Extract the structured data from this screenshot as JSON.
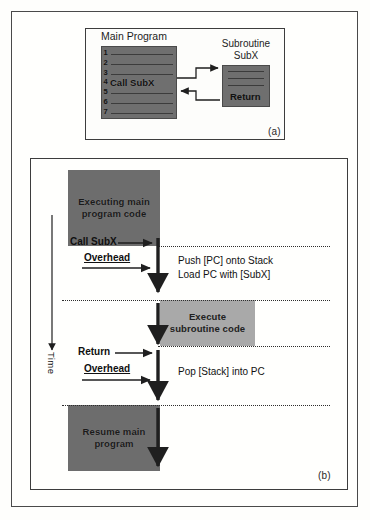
{
  "figure": {
    "panel_a": {
      "caption": "(a)",
      "main_program_title": "Main Program",
      "subroutine_title_line1": "Subroutine",
      "subroutine_title_line2": "SubX",
      "line_numbers": [
        "1",
        "2",
        "3",
        "4",
        "5",
        "6",
        "7"
      ],
      "call_instruction": "Call SubX",
      "return_instruction": "Return"
    },
    "panel_b": {
      "caption": "(b)",
      "time_axis_label": "Time",
      "block_executing_main": "Executing main\nprogram code",
      "block_executing_main_line1": "Executing main",
      "block_executing_main_line2": "program code",
      "block_execute_sub_line1": "Execute",
      "block_execute_sub_line2": "subroutine code",
      "block_resume_line1": "Resume main",
      "block_resume_line2": "program",
      "label_call": "Call SubX",
      "label_return": "Return",
      "label_overhead_call": "Overhead",
      "label_overhead_return": "Overhead",
      "note_push_line1": "Push [PC] onto Stack",
      "note_push_line2": "Load PC with [SubX]",
      "note_pop": "Pop [Stack] into PC"
    }
  },
  "colors": {
    "dark_block": "#6d6d6d",
    "light_block": "#a9a9a9",
    "line": "#2d2d2d",
    "frame": "#3d3d3d"
  }
}
